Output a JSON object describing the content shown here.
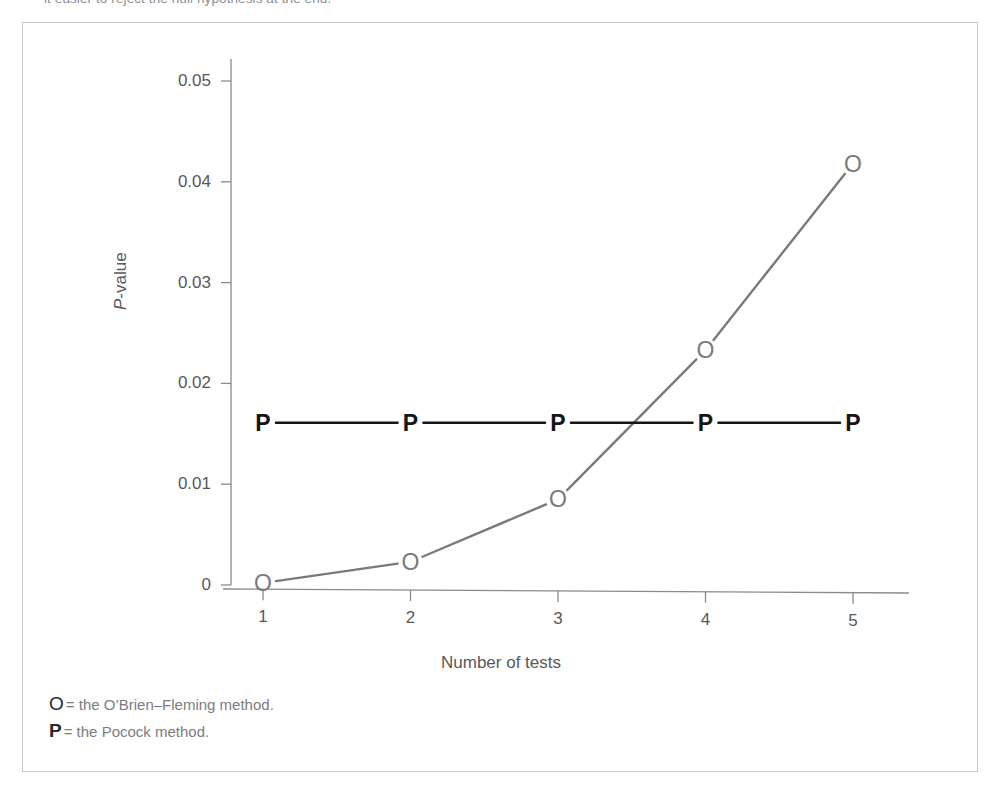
{
  "top_caption": "it easier to reject the null hypothesis at the end.",
  "chart_data": {
    "type": "line",
    "title": "",
    "subtitle": "",
    "xlabel": "Number of tests",
    "ylabel": "P-value",
    "x": [
      1,
      2,
      3,
      4,
      5
    ],
    "xtick_labels": [
      "1",
      "2",
      "3",
      "4",
      "5"
    ],
    "ytick_labels": [
      "0",
      "0.01",
      "0.02",
      "0.03",
      "0.04",
      "0.05"
    ],
    "ytick_values": [
      0,
      0.01,
      0.02,
      0.03,
      0.04,
      0.05
    ],
    "xlim": [
      0.6,
      5.5
    ],
    "ylim": [
      0,
      0.05
    ],
    "grid": false,
    "legend_position": "below-plot",
    "series": [
      {
        "name": "O",
        "label": "the O'Brien–Fleming method.",
        "marker": "O",
        "color": "#7a7a7a",
        "values": [
          0.0002,
          0.0023,
          0.0085,
          0.0233,
          0.0418
        ]
      },
      {
        "name": "P",
        "label": "the Pocock method.",
        "marker": "P",
        "color": "#161616",
        "values": [
          0.0161,
          0.0161,
          0.0161,
          0.0161,
          0.0161
        ]
      }
    ]
  },
  "legend": {
    "rows": [
      {
        "key": "O",
        "equals": "= the O’Brien–Fleming method."
      },
      {
        "key": "P",
        "equals": "= the Pocock method."
      }
    ]
  },
  "colors": {
    "frame": "#c9c9c9",
    "axis": "#8a8a8a",
    "obrien": "#7a7a7a",
    "pocock": "#161616",
    "label_text": "#58585c",
    "legend_text": "#7c7c80"
  }
}
